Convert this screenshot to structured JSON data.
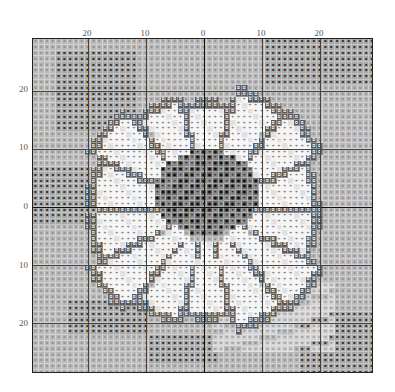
{
  "chart_data": {
    "type": "heatmap",
    "title": "",
    "subtitle": "Sunflower cross-stitch pattern chart",
    "xlabel": "",
    "ylabel": "",
    "x_tick_labels": [
      "20",
      "10",
      "0",
      "10",
      "20"
    ],
    "y_tick_labels": [
      "20",
      "10",
      "0",
      "10",
      "20"
    ],
    "x_tick_positions_px": [
      87,
      145,
      203,
      261,
      319
    ],
    "y_tick_positions_px": [
      89,
      147,
      206,
      265,
      323
    ],
    "grid": true,
    "grid_cells": {
      "columns": 59,
      "rows": 58,
      "cell_size_px": 5.8
    },
    "center_cell": {
      "col": 29,
      "row": 29
    },
    "legend": [],
    "symbols": [
      {
        "id": "bg_light",
        "glyph": "v",
        "color": "#b9b9b9",
        "glyph_color": "#555555",
        "meaning": "light grey background"
      },
      {
        "id": "bg_dark",
        "glyph": "▪",
        "color": "#a6a6a6",
        "glyph_color": "#333333",
        "meaning": "dark grey background"
      },
      {
        "id": "petal_white",
        "glyph": "+",
        "color": "#f4f4f4",
        "glyph_color": "#555555",
        "meaning": "white petal"
      },
      {
        "id": "petal_light",
        "glyph": "·",
        "color": "#e2e2e2",
        "glyph_color": "#888888",
        "meaning": "light petal shading"
      },
      {
        "id": "outline",
        "glyph": "◘",
        "color": "#5a5a5a",
        "glyph_color": "#dddddd",
        "meaning": "petal outline"
      },
      {
        "id": "center_mid",
        "glyph": "▾",
        "color": "#8a8a8a",
        "glyph_color": "#222222",
        "meaning": "flower center mid"
      },
      {
        "id": "center_dark",
        "glyph": "●",
        "color": "#6c6c6c",
        "glyph_color": "#111111",
        "meaning": "flower center dark"
      },
      {
        "id": "water",
        "glyph": "w",
        "color": "#d2d2d2",
        "glyph_color": "#888888",
        "meaning": "light reflection area"
      }
    ]
  }
}
